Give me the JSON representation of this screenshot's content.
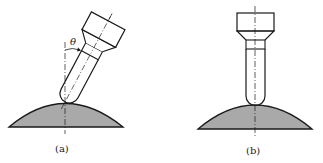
{
  "figures": [
    {
      "id": "a",
      "caption": "(a)",
      "description": "Probe tilted at angle theta contacting curved surface",
      "angle_label": "θ"
    },
    {
      "id": "b",
      "caption": "(b)",
      "description": "Probe vertical contacting curved surface"
    }
  ],
  "colors": {
    "stroke": "#1a1a1a",
    "surface_fill": "#a9a9a9",
    "background": "#ffffff"
  }
}
